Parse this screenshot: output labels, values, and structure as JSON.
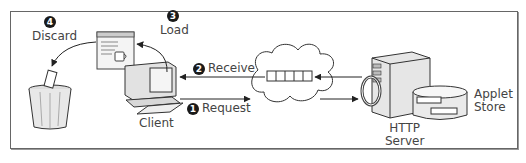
{
  "diagram": {
    "type": "applet-lifecycle",
    "nodes": {
      "client": {
        "label": "Client"
      },
      "server": {
        "label": "HTTP\nServer",
        "line1": "HTTP",
        "line2": "Server"
      },
      "store": {
        "label": "Applet\nStore",
        "line1": "Applet",
        "line2": "Store"
      },
      "network": {
        "label": "Internet cloud"
      },
      "trash": {
        "label": "Trash can"
      },
      "applet_window": {
        "label": "Applet window"
      }
    },
    "steps": [
      {
        "num": "1",
        "label": "Request",
        "from": "client",
        "to": "server"
      },
      {
        "num": "2",
        "label": "Receive",
        "from": "server",
        "to": "client"
      },
      {
        "num": "3",
        "label": "Load",
        "from": "client",
        "to": "applet_window"
      },
      {
        "num": "4",
        "label": "Discard",
        "from": "applet_window",
        "to": "trash"
      }
    ]
  },
  "colors": {
    "stroke": "#333333",
    "fill_light": "#eeeeee",
    "badge": "#1a1a1a",
    "frame": "#666666"
  }
}
